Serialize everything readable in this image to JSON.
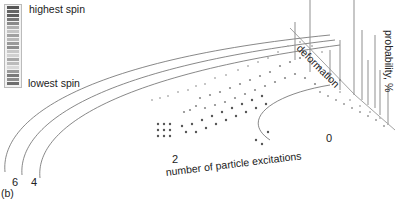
{
  "figure": {
    "panel_label": "(b)",
    "legend": {
      "top_label": "highest spin",
      "bottom_label": "lowest spin",
      "swatches": [
        "#555555",
        "#666666",
        "#5f5f5f",
        "#777777",
        "#8a8a8a",
        "#b0b0b0",
        "#c4c4c4",
        "#a0a0a0",
        "#b8b8b8",
        "#9a9a9a",
        "#8e8e8e",
        "#c8c8c8",
        "#d0d0d0",
        "#a8a8a8",
        "#bcbcbc",
        "#d8d8d8",
        "#9c9c9c",
        "#7a7a7a",
        "#8c8c8c",
        "#6e6e6e"
      ]
    },
    "axes": {
      "x_label": "number of particle excitations",
      "y_label": "deformation",
      "z_label": "probability, %",
      "ticks": [
        {
          "label": "0",
          "x": 328,
          "y": 133
        },
        {
          "label": "2",
          "x": 172,
          "y": 152
        },
        {
          "label": "4",
          "x": 31,
          "y": 177
        },
        {
          "label": "6",
          "x": 12,
          "y": 177
        }
      ]
    },
    "colors": {
      "line": "#6a6a6a",
      "dot_dark": "#555555",
      "dot_mid": "#8a8a8a",
      "dot_light": "#b5b5b5"
    }
  }
}
